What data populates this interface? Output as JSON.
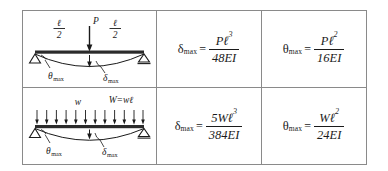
{
  "table": {
    "caption": "Simply supported beam maximum deflection and slope formulas",
    "columns": [
      {
        "key": "diagram",
        "header": "Beam loading diagram"
      },
      {
        "key": "deflection",
        "header": "Maximum deflection"
      },
      {
        "key": "slope",
        "header": "Maximum slope"
      }
    ],
    "rows": [
      {
        "case_name": "simply-supported-center-point-load",
        "diagram": {
          "load_label": "P",
          "span_left_numerator": "ℓ",
          "span_left_denominator": "2",
          "span_right_numerator": "ℓ",
          "span_right_denominator": "2",
          "theta_label": "θ",
          "theta_sub": "max",
          "delta_label": "δ",
          "delta_sub": "max",
          "support_left": "pin-support",
          "support_right": "roller-support",
          "load_arrow_count": 1
        },
        "deflection": {
          "symbol": "δ",
          "subscript": "max",
          "equals": "=",
          "numerator": "Pℓ",
          "numerator_exponent": "3",
          "denominator": "48EI"
        },
        "slope": {
          "symbol": "θ",
          "subscript": "max",
          "equals": "=",
          "numerator": "Pℓ",
          "numerator_exponent": "2",
          "denominator": "16EI"
        }
      },
      {
        "case_name": "simply-supported-uniform-distributed-load",
        "diagram": {
          "load_label": "w",
          "total_load_label": "W=wℓ",
          "theta_label": "θ",
          "theta_sub": "max",
          "delta_label": "δ",
          "delta_sub": "max",
          "support_left": "pin-support",
          "support_right": "roller-support",
          "load_arrow_count": 12
        },
        "deflection": {
          "symbol": "δ",
          "subscript": "max",
          "equals": "=",
          "numerator": "5Wℓ",
          "numerator_exponent": "3",
          "denominator": "384EI"
        },
        "slope": {
          "symbol": "θ",
          "subscript": "max",
          "equals": "=",
          "numerator": "Wℓ",
          "numerator_exponent": "2",
          "denominator": "24EI"
        }
      }
    ]
  },
  "colors": {
    "border": "#8a8a8a",
    "ink": "#1a1a1a",
    "beam": "#2b2b2b",
    "background": "#ffffff"
  }
}
